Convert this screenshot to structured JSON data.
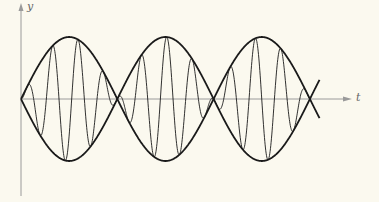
{
  "chart_data": {
    "type": "line",
    "title": "",
    "xlabel": "t",
    "ylabel": "y",
    "grid": false,
    "legend": null,
    "envelope": {
      "nodes_t": [
        0,
        1,
        2,
        3
      ],
      "lobes": 3,
      "amplitude": 1,
      "upper_curve": "A*|sin(pi*t)| drawn as crossing sinusoids +A sin(pi t) and -A sin(pi t)"
    },
    "carrier": {
      "cycles_per_lobe": 3.8
    },
    "series": [
      {
        "name": "envelope_upper",
        "expr": "sin(pi*t)"
      },
      {
        "name": "envelope_lower",
        "expr": "-sin(pi*t)"
      },
      {
        "name": "signal",
        "expr": "sin(pi*t)*sin(2*pi*3.8*t)"
      }
    ],
    "x_range": [
      0,
      3.1
    ],
    "y_range": [
      -1.5,
      1.5
    ],
    "colors": {
      "axes": "#9a9a9a",
      "curves": "#1a1a1a",
      "background": "#fbf9ef"
    }
  },
  "axes": {
    "x_label": "t",
    "y_label": "y"
  }
}
